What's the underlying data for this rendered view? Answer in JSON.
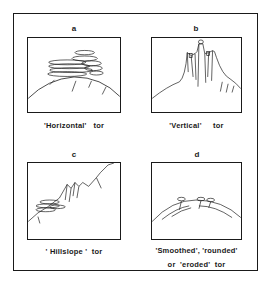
{
  "figure": {
    "panels": [
      {
        "id": "a",
        "label": "a",
        "caption": "'Horizontal'   tor",
        "type": "horizontal-tor"
      },
      {
        "id": "b",
        "label": "b",
        "caption": "'Vertical'     tor",
        "type": "vertical-tor"
      },
      {
        "id": "c",
        "label": "c",
        "caption": "' Hillslope '  tor",
        "type": "hillslope-tor"
      },
      {
        "id": "d",
        "label": "d",
        "caption_lines": [
          "'Smoothed', 'rounded'",
          "or  'eroded'  tor"
        ],
        "type": "smoothed-tor"
      }
    ]
  }
}
